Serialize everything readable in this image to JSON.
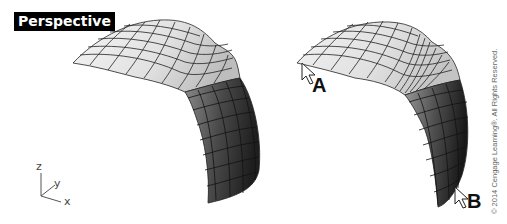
{
  "viewport": {
    "title": "Perspective"
  },
  "axes": {
    "x": "x",
    "y": "y",
    "z": "z"
  },
  "markers": {
    "a": "A",
    "b": "B"
  },
  "copyright": "© 2014 Cengage Learning®. All Rights Reserved.",
  "colors": {
    "background": "#ffffff",
    "label_bg": "#000000",
    "label_fg": "#ffffff",
    "surface_light": "#eeeeee",
    "surface_dark": "#2a2a2a",
    "isocurve": "#222222"
  }
}
